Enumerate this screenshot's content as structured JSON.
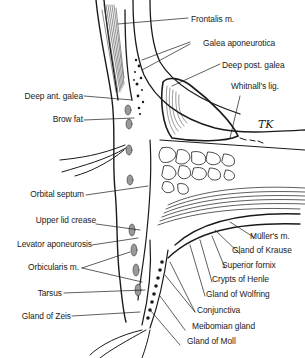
{
  "figure": {
    "signature": "TK",
    "colors": {
      "ink": "#1a1a1a",
      "background": "#ffffff",
      "shade": "#9a9a9a"
    }
  },
  "labels": {
    "right": [
      {
        "id": "frontalis",
        "text": "Frontalis m."
      },
      {
        "id": "galea_aponeurotica",
        "text": "Galea aponeurotica"
      },
      {
        "id": "deep_post_galea",
        "text": "Deep post. galea"
      },
      {
        "id": "whitnalls_lig",
        "text": "Whitnall's lig."
      },
      {
        "id": "mullers_m",
        "text": "Müller's m."
      },
      {
        "id": "gland_of_krause",
        "text": "Gland of Krause"
      },
      {
        "id": "superior_fornix",
        "text": "Superior fornix"
      },
      {
        "id": "crypts_of_henle",
        "text": "Crypts of Henle"
      },
      {
        "id": "gland_of_wolfring",
        "text": "Gland of Wolfring"
      },
      {
        "id": "conjunctiva",
        "text": "Conjunctiva"
      },
      {
        "id": "meibomian_gland",
        "text": "Meibomian gland"
      },
      {
        "id": "gland_of_moll",
        "text": "Gland of Moll"
      }
    ],
    "left": [
      {
        "id": "deep_ant_galea",
        "text": "Deep ant. galea"
      },
      {
        "id": "brow_fat",
        "text": "Brow fat"
      },
      {
        "id": "orbital_septum",
        "text": "Orbital septum"
      },
      {
        "id": "upper_lid_crease",
        "text": "Upper lid crease"
      },
      {
        "id": "levator_aponeurosis",
        "text": "Levator aponeurosis"
      },
      {
        "id": "orbicularis_m",
        "text": "Orbicularis m."
      },
      {
        "id": "tarsus",
        "text": "Tarsus"
      },
      {
        "id": "gland_of_zeis",
        "text": "Gland of Zeis"
      }
    ]
  }
}
